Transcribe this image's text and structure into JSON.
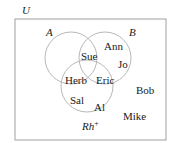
{
  "diagram": {
    "type": "venn",
    "universe": {
      "label": "U"
    },
    "sets": [
      {
        "id": "A",
        "label": "A"
      },
      {
        "id": "B",
        "label": "B"
      },
      {
        "id": "Rh",
        "label": "Rh",
        "superscript": "+"
      }
    ],
    "elements": [
      {
        "name": "Sue",
        "region": "A∩B"
      },
      {
        "name": "Ann",
        "region": "B only"
      },
      {
        "name": "Jo",
        "region": "B only"
      },
      {
        "name": "Herb",
        "region": "A∩Rh+"
      },
      {
        "name": "Eric",
        "region": "A∩B∩Rh+ / B∩Rh+"
      },
      {
        "name": "Sal",
        "region": "Rh+ only"
      },
      {
        "name": "Al",
        "region": "Rh+ only"
      },
      {
        "name": "Bob",
        "region": "outside"
      },
      {
        "name": "Mike",
        "region": "outside"
      }
    ],
    "colors": {
      "stroke": "#b8b8b8",
      "box": "#a0a0a0",
      "text": "#1a1a1a"
    }
  }
}
